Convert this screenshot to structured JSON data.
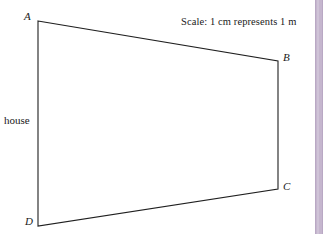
{
  "figure": {
    "type": "geometry-diagram",
    "background_color": "#ffffff",
    "line_color": "#1f1f1f",
    "line_width": 1.1,
    "vertices": [
      {
        "id": "A",
        "label": "A",
        "x": 38,
        "y": 21
      },
      {
        "id": "B",
        "label": "B",
        "x": 278,
        "y": 61
      },
      {
        "id": "C",
        "label": "C",
        "x": 278,
        "y": 189
      },
      {
        "id": "D",
        "label": "D",
        "x": 38,
        "y": 226
      }
    ],
    "edges": [
      {
        "name": "AB",
        "from": "A",
        "to": "B"
      },
      {
        "name": "BC",
        "from": "B",
        "to": "C"
      },
      {
        "name": "CD",
        "from": "C",
        "to": "D"
      },
      {
        "name": "DA",
        "from": "D",
        "to": "A"
      }
    ],
    "polygon_points": "38,21 278,61 278,189 38,226",
    "labels": {
      "vertex_a": "A",
      "vertex_b": "B",
      "vertex_c": "C",
      "vertex_d": "D",
      "house": "house",
      "scale_note": "Scale: 1 cm represents 1 m"
    }
  },
  "decoration": {
    "right_strip_color": "#c5b6ce",
    "right_strip_edge_color": "#b9a8c4",
    "right_strip_highlight_color": "#cfc3d7"
  }
}
